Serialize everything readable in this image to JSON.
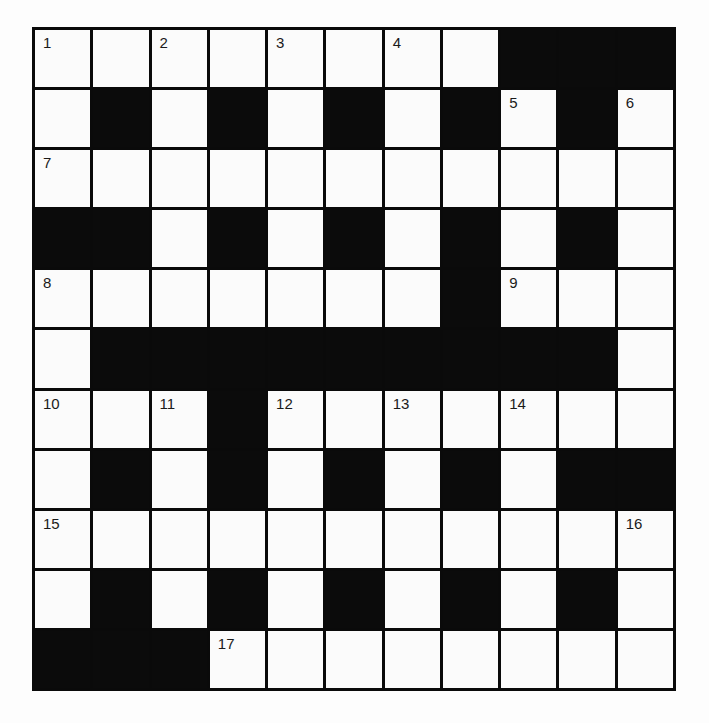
{
  "puzzle": {
    "rows": 11,
    "cols": 11,
    "colors": {
      "block": "#0b0b0b",
      "cell": "#fbfbfb",
      "grid_line": "#0a0a0a"
    },
    "layout": [
      "WWWWWWWWBBB",
      "WBWBWBWBWBW",
      "WWWWWWWWWWW",
      "BBWBWBWBWBW",
      "WWWWWWWBWWW",
      "WBBBBBBBBBW",
      "WWWBWWWWWWW",
      "WBWBWBWBWBB",
      "WWWWWWWWWWW",
      "WBWBWBWBWBW",
      "BBBWWWWWWWW"
    ],
    "numbers": [
      {
        "row": 0,
        "col": 0,
        "n": "1"
      },
      {
        "row": 0,
        "col": 2,
        "n": "2"
      },
      {
        "row": 0,
        "col": 4,
        "n": "3"
      },
      {
        "row": 0,
        "col": 6,
        "n": "4"
      },
      {
        "row": 1,
        "col": 8,
        "n": "5"
      },
      {
        "row": 1,
        "col": 10,
        "n": "6"
      },
      {
        "row": 2,
        "col": 0,
        "n": "7"
      },
      {
        "row": 4,
        "col": 0,
        "n": "8"
      },
      {
        "row": 4,
        "col": 8,
        "n": "9"
      },
      {
        "row": 6,
        "col": 0,
        "n": "10"
      },
      {
        "row": 6,
        "col": 2,
        "n": "11"
      },
      {
        "row": 6,
        "col": 4,
        "n": "12"
      },
      {
        "row": 6,
        "col": 6,
        "n": "13"
      },
      {
        "row": 6,
        "col": 8,
        "n": "14"
      },
      {
        "row": 8,
        "col": 0,
        "n": "15"
      },
      {
        "row": 8,
        "col": 10,
        "n": "16"
      },
      {
        "row": 10,
        "col": 3,
        "n": "17"
      }
    ],
    "entries": {}
  }
}
